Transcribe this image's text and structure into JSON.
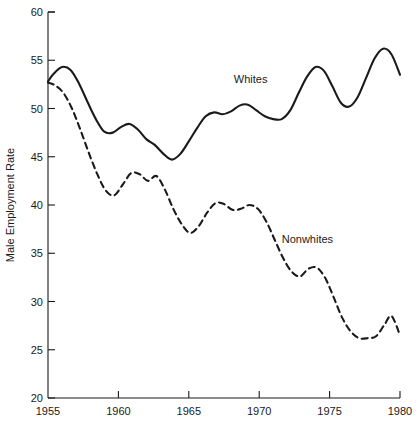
{
  "chart_data": {
    "type": "line",
    "title": "",
    "subtitle": "",
    "xlabel": "",
    "ylabel": "Male Employment Rate",
    "xlim": [
      1955,
      1980
    ],
    "ylim": [
      20,
      60
    ],
    "xticks": [
      1955,
      1960,
      1965,
      1970,
      1975,
      1980
    ],
    "yticks": [
      20,
      25,
      30,
      35,
      40,
      45,
      50,
      55,
      60
    ],
    "xtick_labels": [
      "1955",
      "1960",
      "1965",
      "1970",
      "1975",
      "1980"
    ],
    "ytick_labels": [
      "20",
      "25",
      "30",
      "35",
      "40",
      "45",
      "50",
      "55",
      "60"
    ],
    "grid": false,
    "legend": "inline-annotations",
    "legend_position": "inline",
    "line_color": "#1a1a1a",
    "background_color": "#ffffff",
    "annotations": [
      {
        "text": "Whites",
        "x": 1968.2,
        "y": 52.6
      },
      {
        "text": "Nonwhites",
        "x": 1971.6,
        "y": 36.1
      }
    ],
    "series": [
      {
        "name": "Whites",
        "style": "solid",
        "label": "Whites",
        "x": [
          1955.0,
          1955.4,
          1956.0,
          1956.6,
          1957.2,
          1957.8,
          1958.4,
          1959.0,
          1959.6,
          1960.2,
          1960.8,
          1961.4,
          1962.0,
          1962.6,
          1963.2,
          1963.8,
          1964.4,
          1965.0,
          1965.6,
          1966.2,
          1966.8,
          1967.4,
          1968.0,
          1968.6,
          1969.2,
          1969.8,
          1970.4,
          1971.0,
          1971.6,
          1972.2,
          1972.8,
          1973.4,
          1974.0,
          1974.6,
          1975.2,
          1975.8,
          1976.4,
          1977.0,
          1977.6,
          1978.2,
          1978.8,
          1979.4,
          1980.0
        ],
        "y": [
          52.8,
          53.6,
          54.3,
          54.0,
          52.6,
          50.7,
          48.9,
          47.6,
          47.5,
          48.1,
          48.4,
          47.8,
          46.8,
          46.2,
          45.3,
          44.7,
          45.3,
          46.6,
          48.0,
          49.2,
          49.6,
          49.4,
          49.7,
          50.3,
          50.4,
          49.8,
          49.2,
          48.9,
          48.9,
          49.8,
          51.6,
          53.3,
          54.3,
          53.9,
          52.3,
          50.6,
          50.2,
          51.2,
          53.2,
          55.2,
          56.2,
          55.6,
          53.5
        ]
      },
      {
        "name": "Nonwhites",
        "style": "dashed",
        "label": "Nonwhites",
        "x": [
          1955.0,
          1955.5,
          1956.1,
          1956.7,
          1957.3,
          1957.9,
          1958.5,
          1959.1,
          1959.7,
          1960.3,
          1960.9,
          1961.5,
          1962.1,
          1962.7,
          1963.3,
          1963.9,
          1964.5,
          1965.1,
          1965.7,
          1966.3,
          1966.9,
          1967.5,
          1968.1,
          1968.7,
          1969.3,
          1969.9,
          1970.5,
          1971.1,
          1971.7,
          1972.3,
          1972.9,
          1973.5,
          1974.1,
          1974.7,
          1975.3,
          1975.9,
          1976.5,
          1977.1,
          1977.7,
          1978.3,
          1978.9,
          1979.4,
          1980.0
        ],
        "y": [
          52.7,
          52.4,
          51.6,
          50.0,
          47.8,
          45.4,
          43.2,
          41.5,
          41.0,
          42.1,
          43.3,
          43.2,
          42.5,
          43.0,
          41.6,
          39.6,
          38.0,
          37.1,
          37.8,
          39.2,
          40.2,
          40.1,
          39.5,
          39.6,
          40.0,
          39.6,
          38.3,
          36.4,
          34.5,
          33.1,
          32.6,
          33.4,
          33.5,
          32.4,
          30.4,
          28.3,
          26.9,
          26.2,
          26.2,
          26.4,
          27.6,
          28.5,
          26.5
        ]
      }
    ]
  }
}
